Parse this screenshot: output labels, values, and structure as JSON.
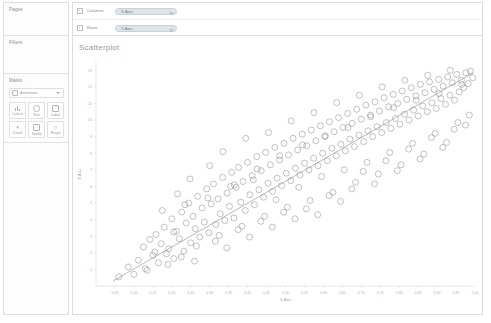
{
  "sidebar": {
    "pages": {
      "title": "Pages"
    },
    "filters": {
      "title": "Filters"
    },
    "marks": {
      "title": "Marks",
      "type_selector": {
        "label": "Automatic",
        "icon": "automatic-mark-icon",
        "caret": "chevron-down-icon"
      },
      "buttons": [
        {
          "label": "Colour",
          "icon": "colour-icon"
        },
        {
          "label": "Size",
          "icon": "size-icon"
        },
        {
          "label": "Label",
          "icon": "label-icon"
        },
        {
          "label": "Detail",
          "icon": "detail-icon"
        },
        {
          "label": "Tooltip",
          "icon": "tooltip-icon"
        },
        {
          "label": "Shape",
          "icon": "shape-icon"
        }
      ]
    }
  },
  "shelves": [
    {
      "name": "Columns",
      "icon": "columns-shelf-icon",
      "pill": "X-Axis"
    },
    {
      "name": "Rows",
      "icon": "rows-shelf-icon",
      "pill": "Y-Axis"
    }
  ],
  "view": {
    "title": "Scatterplot"
  },
  "colors": {
    "pill_fill": "#dfe4ea",
    "pill_text": "#6d7681",
    "point_stroke": "#8f8f8f",
    "trend_line": "#8a8a8a",
    "axis": "#cfcfcf",
    "panel_border": "#dcdcdc"
  },
  "chart_data": {
    "type": "scatter",
    "title": "Scatterplot",
    "xlabel": "X-Axis",
    "ylabel": "Y-Axis",
    "grid": false,
    "legend": "none",
    "xlim": [
      0.0,
      1.0
    ],
    "ylim": [
      0,
      13.5
    ],
    "xticks": [
      0.05,
      0.1,
      0.15,
      0.2,
      0.25,
      0.3,
      0.35,
      0.4,
      0.45,
      0.5,
      0.55,
      0.6,
      0.65,
      0.7,
      0.75,
      0.8,
      0.85,
      0.9,
      0.95,
      1.0
    ],
    "xtick_labels": [
      "0.05",
      "0.10",
      "0.15",
      "0.20",
      "0.25",
      "0.30",
      "0.35",
      "0.40",
      "0.45",
      "0.50",
      "0.55",
      "0.60",
      "0.65",
      "0.70",
      "0.75",
      "0.80",
      "0.85",
      "0.90",
      "0.95",
      "1.00"
    ],
    "yticks": [
      1,
      2,
      3,
      4,
      5,
      6,
      7,
      8,
      9,
      10,
      11,
      12,
      13
    ],
    "ytick_labels": [
      "1",
      "2",
      "3",
      "4",
      "5",
      "6",
      "7",
      "8",
      "9",
      "10",
      "11",
      "12",
      "13"
    ],
    "marker": {
      "shape": "circle-open",
      "size": 3.0,
      "stroke": "#8f8f8f",
      "fill": "none"
    },
    "trendline": {
      "show": true,
      "type": "linear",
      "color": "#8a8a8a",
      "x0": 0.045,
      "y0": 0.3,
      "x1": 0.995,
      "y1": 12.85
    },
    "series": [
      {
        "name": "points",
        "points": [
          [
            0.06,
            0.55
          ],
          [
            0.085,
            1.15
          ],
          [
            0.1,
            0.7
          ],
          [
            0.112,
            1.55
          ],
          [
            0.125,
            2.35
          ],
          [
            0.13,
            1.05
          ],
          [
            0.142,
            2.8
          ],
          [
            0.15,
            1.85
          ],
          [
            0.158,
            3.1
          ],
          [
            0.165,
            1.4
          ],
          [
            0.172,
            2.55
          ],
          [
            0.18,
            3.55
          ],
          [
            0.186,
            1.95
          ],
          [
            0.192,
            2.25
          ],
          [
            0.2,
            4.05
          ],
          [
            0.205,
            1.65
          ],
          [
            0.212,
            3.3
          ],
          [
            0.22,
            2.85
          ],
          [
            0.226,
            4.45
          ],
          [
            0.232,
            2.1
          ],
          [
            0.238,
            3.8
          ],
          [
            0.245,
            5.0
          ],
          [
            0.25,
            2.6
          ],
          [
            0.256,
            4.2
          ],
          [
            0.262,
            3.45
          ],
          [
            0.268,
            5.4
          ],
          [
            0.274,
            2.95
          ],
          [
            0.28,
            4.7
          ],
          [
            0.286,
            3.85
          ],
          [
            0.292,
            5.85
          ],
          [
            0.298,
            3.2
          ],
          [
            0.304,
            4.95
          ],
          [
            0.31,
            6.15
          ],
          [
            0.316,
            3.7
          ],
          [
            0.322,
            5.25
          ],
          [
            0.328,
            4.35
          ],
          [
            0.334,
            6.55
          ],
          [
            0.34,
            3.95
          ],
          [
            0.346,
            5.6
          ],
          [
            0.352,
            4.8
          ],
          [
            0.358,
            6.85
          ],
          [
            0.364,
            4.1
          ],
          [
            0.37,
            5.95
          ],
          [
            0.376,
            7.15
          ],
          [
            0.382,
            5.05
          ],
          [
            0.388,
            6.3
          ],
          [
            0.394,
            4.55
          ],
          [
            0.4,
            7.45
          ],
          [
            0.406,
            5.5
          ],
          [
            0.412,
            6.65
          ],
          [
            0.418,
            4.9
          ],
          [
            0.424,
            7.8
          ],
          [
            0.43,
            5.8
          ],
          [
            0.436,
            6.95
          ],
          [
            0.442,
            5.35
          ],
          [
            0.448,
            8.05
          ],
          [
            0.454,
            6.2
          ],
          [
            0.46,
            7.3
          ],
          [
            0.466,
            5.7
          ],
          [
            0.472,
            8.35
          ],
          [
            0.478,
            6.5
          ],
          [
            0.484,
            7.6
          ],
          [
            0.49,
            6.05
          ],
          [
            0.496,
            8.6
          ],
          [
            0.502,
            6.8
          ],
          [
            0.508,
            7.9
          ],
          [
            0.514,
            6.35
          ],
          [
            0.52,
            8.9
          ],
          [
            0.526,
            7.1
          ],
          [
            0.532,
            8.2
          ],
          [
            0.538,
            6.7
          ],
          [
            0.544,
            9.15
          ],
          [
            0.55,
            7.4
          ],
          [
            0.556,
            8.45
          ],
          [
            0.562,
            7.0
          ],
          [
            0.568,
            9.4
          ],
          [
            0.574,
            7.7
          ],
          [
            0.58,
            8.75
          ],
          [
            0.586,
            7.25
          ],
          [
            0.592,
            9.65
          ],
          [
            0.598,
            8.0
          ],
          [
            0.604,
            9.0
          ],
          [
            0.61,
            7.55
          ],
          [
            0.616,
            9.9
          ],
          [
            0.622,
            8.3
          ],
          [
            0.628,
            9.3
          ],
          [
            0.634,
            7.85
          ],
          [
            0.64,
            10.15
          ],
          [
            0.646,
            8.55
          ],
          [
            0.652,
            9.55
          ],
          [
            0.658,
            8.15
          ],
          [
            0.664,
            10.4
          ],
          [
            0.67,
            8.85
          ],
          [
            0.676,
            9.8
          ],
          [
            0.682,
            8.4
          ],
          [
            0.688,
            10.65
          ],
          [
            0.694,
            9.1
          ],
          [
            0.7,
            10.05
          ],
          [
            0.706,
            8.7
          ],
          [
            0.712,
            10.9
          ],
          [
            0.718,
            9.35
          ],
          [
            0.724,
            10.3
          ],
          [
            0.73,
            9.0
          ],
          [
            0.736,
            11.1
          ],
          [
            0.742,
            9.6
          ],
          [
            0.748,
            10.55
          ],
          [
            0.754,
            9.25
          ],
          [
            0.76,
            11.35
          ],
          [
            0.766,
            9.85
          ],
          [
            0.772,
            10.8
          ],
          [
            0.778,
            9.5
          ],
          [
            0.784,
            11.55
          ],
          [
            0.79,
            10.1
          ],
          [
            0.796,
            11.0
          ],
          [
            0.802,
            9.75
          ],
          [
            0.808,
            11.75
          ],
          [
            0.814,
            10.35
          ],
          [
            0.82,
            11.25
          ],
          [
            0.826,
            10.0
          ],
          [
            0.832,
            11.95
          ],
          [
            0.838,
            10.6
          ],
          [
            0.844,
            11.45
          ],
          [
            0.85,
            10.25
          ],
          [
            0.856,
            12.15
          ],
          [
            0.862,
            10.85
          ],
          [
            0.868,
            11.65
          ],
          [
            0.874,
            10.5
          ],
          [
            0.88,
            12.3
          ],
          [
            0.886,
            11.05
          ],
          [
            0.892,
            11.85
          ],
          [
            0.898,
            10.7
          ],
          [
            0.904,
            12.45
          ],
          [
            0.91,
            11.3
          ],
          [
            0.916,
            12.05
          ],
          [
            0.922,
            10.95
          ],
          [
            0.928,
            12.6
          ],
          [
            0.934,
            11.5
          ],
          [
            0.94,
            12.25
          ],
          [
            0.946,
            11.2
          ],
          [
            0.952,
            12.75
          ],
          [
            0.958,
            11.7
          ],
          [
            0.964,
            12.4
          ],
          [
            0.97,
            11.95
          ],
          [
            0.976,
            12.85
          ],
          [
            0.982,
            12.2
          ],
          [
            0.988,
            12.95
          ],
          [
            0.994,
            12.55
          ],
          [
            0.215,
            5.55
          ],
          [
            0.248,
            6.45
          ],
          [
            0.3,
            7.25
          ],
          [
            0.335,
            8.1
          ],
          [
            0.365,
            6.1
          ],
          [
            0.395,
            8.9
          ],
          [
            0.425,
            7.05
          ],
          [
            0.455,
            9.25
          ],
          [
            0.485,
            7.85
          ],
          [
            0.515,
            9.95
          ],
          [
            0.545,
            8.5
          ],
          [
            0.575,
            10.45
          ],
          [
            0.605,
            9.05
          ],
          [
            0.635,
            11.05
          ],
          [
            0.665,
            9.55
          ],
          [
            0.695,
            11.5
          ],
          [
            0.725,
            10.2
          ],
          [
            0.755,
            12.0
          ],
          [
            0.785,
            10.75
          ],
          [
            0.815,
            12.4
          ],
          [
            0.845,
            11.2
          ],
          [
            0.875,
            12.7
          ],
          [
            0.905,
            11.6
          ],
          [
            0.935,
            13.0
          ],
          [
            0.965,
            12.15
          ],
          [
            0.175,
            4.55
          ],
          [
            0.205,
            3.25
          ],
          [
            0.235,
            4.9
          ],
          [
            0.265,
            2.4
          ],
          [
            0.295,
            5.3
          ],
          [
            0.325,
            3.05
          ],
          [
            0.355,
            6.0
          ],
          [
            0.385,
            3.6
          ],
          [
            0.415,
            6.4
          ],
          [
            0.445,
            4.2
          ],
          [
            0.475,
            5.2
          ],
          [
            0.505,
            4.75
          ],
          [
            0.535,
            5.95
          ],
          [
            0.565,
            5.15
          ],
          [
            0.595,
            6.6
          ],
          [
            0.625,
            5.65
          ],
          [
            0.655,
            7.0
          ],
          [
            0.685,
            6.25
          ],
          [
            0.715,
            7.45
          ],
          [
            0.745,
            6.75
          ],
          [
            0.775,
            8.05
          ],
          [
            0.805,
            7.3
          ],
          [
            0.835,
            8.6
          ],
          [
            0.865,
            7.95
          ],
          [
            0.895,
            9.2
          ],
          [
            0.925,
            8.65
          ],
          [
            0.955,
            9.85
          ],
          [
            0.985,
            10.3
          ],
          [
            0.135,
            0.95
          ],
          [
            0.155,
            2.05
          ],
          [
            0.19,
            1.3
          ],
          [
            0.225,
            1.75
          ],
          [
            0.26,
            1.5
          ],
          [
            0.315,
            2.7
          ],
          [
            0.345,
            2.3
          ],
          [
            0.375,
            3.4
          ],
          [
            0.405,
            2.95
          ],
          [
            0.435,
            3.9
          ],
          [
            0.465,
            3.55
          ],
          [
            0.495,
            4.45
          ],
          [
            0.525,
            4.05
          ],
          [
            0.555,
            4.65
          ],
          [
            0.585,
            4.3
          ],
          [
            0.615,
            5.45
          ],
          [
            0.645,
            5.1
          ],
          [
            0.675,
            5.85
          ],
          [
            0.705,
            6.9
          ],
          [
            0.735,
            6.15
          ],
          [
            0.765,
            7.55
          ],
          [
            0.795,
            6.95
          ],
          [
            0.825,
            8.25
          ],
          [
            0.855,
            7.65
          ],
          [
            0.885,
            8.95
          ],
          [
            0.915,
            8.35
          ],
          [
            0.945,
            9.45
          ],
          [
            0.975,
            9.7
          ]
        ]
      }
    ]
  }
}
